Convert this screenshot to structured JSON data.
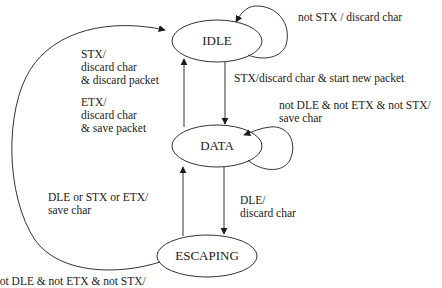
{
  "diagram": {
    "type": "state-machine",
    "states": [
      {
        "id": "idle",
        "label": "IDLE"
      },
      {
        "id": "data",
        "label": "DATA"
      },
      {
        "id": "escaping",
        "label": "ESCAPING"
      }
    ],
    "transitions": {
      "idle_self": {
        "from": "IDLE",
        "to": "IDLE",
        "lines": [
          "not STX / discard char"
        ]
      },
      "idle_to_data": {
        "from": "IDLE",
        "to": "DATA",
        "lines": [
          "STX/discard char & start new packet"
        ]
      },
      "data_to_idle": {
        "from": "DATA",
        "to": "IDLE",
        "lines": [
          "STX/",
          "discard char",
          "& discard packet",
          "",
          "ETX/",
          "discard char",
          "& save packet"
        ]
      },
      "data_self": {
        "from": "DATA",
        "to": "DATA",
        "lines": [
          "not DLE & not ETX & not STX/",
          "save char"
        ]
      },
      "data_to_escaping": {
        "from": "DATA",
        "to": "ESCAPING",
        "lines": [
          "DLE/",
          "discard char"
        ]
      },
      "escaping_to_data": {
        "from": "ESCAPING",
        "to": "DATA",
        "lines": [
          "DLE or STX or ETX/",
          "save char"
        ]
      },
      "escaping_to_idle": {
        "from": "ESCAPING",
        "to": "IDLE",
        "lines": [
          "not DLE & not ETX & not STX/"
        ]
      }
    }
  },
  "colors": {
    "stroke": "#333333",
    "text": "#1a1a1a",
    "background": "#ffffff"
  }
}
